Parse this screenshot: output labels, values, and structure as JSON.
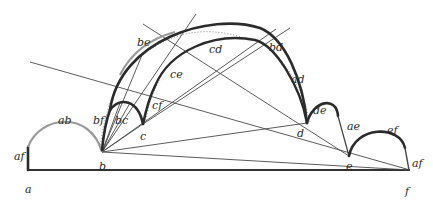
{
  "diagram": {
    "title": "",
    "points": [
      {
        "id": "a",
        "label": "a"
      },
      {
        "id": "b",
        "label": "b"
      },
      {
        "id": "c",
        "label": "c"
      },
      {
        "id": "d",
        "label": "d"
      },
      {
        "id": "e",
        "label": "e"
      },
      {
        "id": "f",
        "label": "f"
      }
    ],
    "arc_labels": {
      "af_left": "af",
      "ab": "ab",
      "bf": "bf",
      "bc": "bc",
      "be": "be",
      "cf": "cf",
      "ce": "ce",
      "cd": "cd",
      "bd": "bd",
      "ad": "ad",
      "de": "de",
      "ae": "ae",
      "ef": "ef",
      "af_right": "af"
    },
    "colors": {
      "thick_stroke": "#2b2b2b",
      "gray_stroke": "#9a9a9a",
      "thin_stroke": "#4a4a4a",
      "background": "#ffffff"
    }
  }
}
